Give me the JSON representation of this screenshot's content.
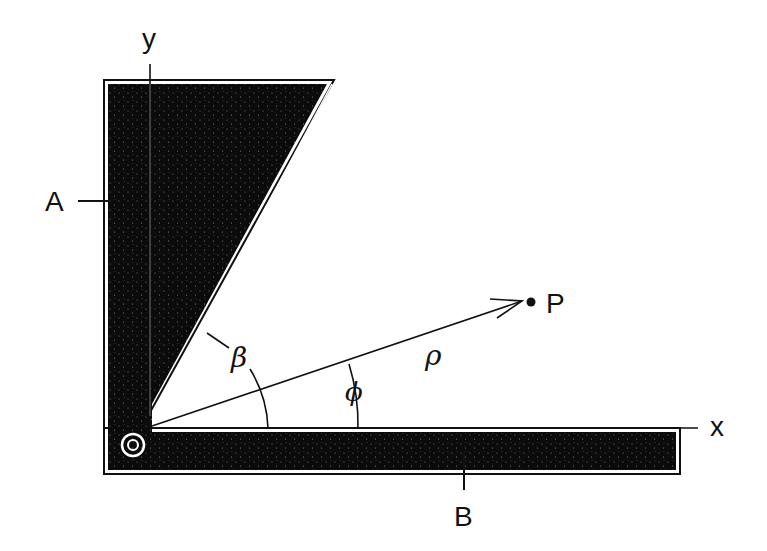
{
  "diagram": {
    "title": "",
    "colors": {
      "fill": "#0b0b0b",
      "line": "#111111",
      "background": "#ffffff"
    },
    "labels": {
      "y_axis": "y",
      "x_axis": "x",
      "plate_a": "A",
      "plate_b": "B",
      "point": "P",
      "angle_beta": "β",
      "angle_phi": "ϕ",
      "radius": "ρ"
    },
    "elements": [
      {
        "id": "plate-a",
        "description": "Wedge-shaped conductor along y-axis, inclined at angle β"
      },
      {
        "id": "plate-b",
        "description": "Flat conductor along x-axis"
      },
      {
        "id": "origin",
        "description": "Origin marker (circle) at corner"
      },
      {
        "id": "vector-rho",
        "description": "Radial vector from origin to point P at angle ϕ"
      }
    ]
  }
}
